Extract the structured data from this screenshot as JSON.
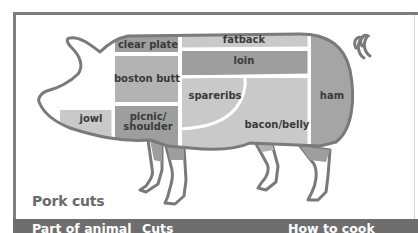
{
  "diagram": {
    "title": "Pork cuts",
    "cuts": [
      {
        "id": "clear-plate",
        "label": "clear plate"
      },
      {
        "id": "fatback",
        "label": "fatback"
      },
      {
        "id": "loin",
        "label": "loin"
      },
      {
        "id": "boston-butt",
        "label": "boston butt"
      },
      {
        "id": "spareribs",
        "label": "spareribs"
      },
      {
        "id": "ham",
        "label": "ham"
      },
      {
        "id": "jowl",
        "label": "jowl"
      },
      {
        "id": "picnic-shoulder",
        "label_line1": "picnic/",
        "label_line2": "shoulder"
      },
      {
        "id": "bacon-belly",
        "label": "bacon/belly"
      }
    ],
    "colors": {
      "outline": "#7a7a7a",
      "light_region": "#c9c9c9",
      "medium_region": "#b3b3b3",
      "dark_region": "#9e9e9e",
      "header_bar": "#6e6e6e"
    }
  },
  "table_header": {
    "columns": [
      "Part of animal",
      "Cuts",
      "How to cook"
    ]
  }
}
